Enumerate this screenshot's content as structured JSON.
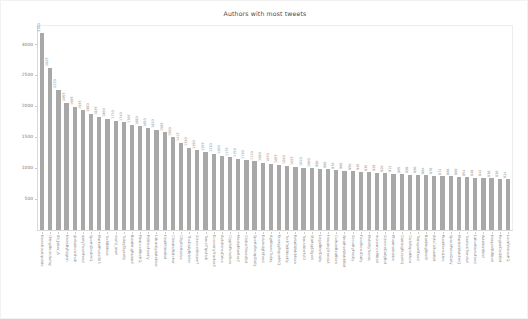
{
  "figure": {
    "title": "Authors with most tweets",
    "background_color": "#ffffff",
    "bar_color": "#a8a8a8",
    "axis_color": "#d9d9d9",
    "text_color": "#777777"
  },
  "legend": {
    "position": "top-right",
    "entries": [
      {
        "label": "author",
        "swatch_name": "legend-swatch-author",
        "color": "#a6a6a6"
      }
    ]
  },
  "chart_data": {
    "type": "bar",
    "title": "Authors with most tweets",
    "xlabel": "",
    "ylabel": "",
    "ylim": [
      0,
      3300
    ],
    "grid": false,
    "legend_position": "top-right",
    "yticks": [
      500,
      1000,
      1500,
      2000,
      2500,
      3000
    ],
    "ytick_labels": [
      "500",
      "1000",
      "1500",
      "2000",
      "2500",
      "3000"
    ],
    "series_name": "author",
    "categories": [
      "NewsHourUpdate",
      "chingdbuncliufay",
      "Ali_Jaber_A",
      "NewsByRegion",
      "globalnewshub",
      "dailyTweetFeed",
      "SportsDeskHQ",
      "MarketPulse365",
      "TechBitNow",
      "world_alert",
      "TodayDigestly",
      "BreakingRadarX",
      "FinanceWireHQ",
      "PoliticoFeedly",
      "UrbanUpdateNow",
      "HealthlineBot",
      "ClimateWatcher",
      "CityAlertsLive",
      "TheDailyBriefer",
      "ScienceStream7",
      "TravelTipsHub",
      "EconomyTrackerX",
      "AutoNewsDrive",
      "CryptoPulseNow",
      "MediaMonitorZ",
      "GlobalTimesBot",
      "SportsRecapDaily",
      "EduInsightFeed",
      "AgriNewsToday",
      "EnergyReportHQ",
      "TechTalkWeekly",
      "RetailWatchNow",
      "TravelAlertsIO",
      "StartupDigest",
      "LegalBriefDaily",
      "HousingTrendsX",
      "CultureBeatNow",
      "WeatherWatchBot",
      "SecurityFeedly",
      "FoodNewsDaily",
      "MobilityTrends",
      "InsuranceWireX",
      "ScienceDailyBot",
      "PharmaInsider",
      "GamingPulseHQ",
      "CivicReportNow",
      "TransportFeed",
      "BankingBriefX",
      "ArtsCultureBot",
      "RuralNewsLine",
      "SpacePulseDaily",
      "MarineWatchHQ",
      "TourismTrendsX",
      "LaborNewsFeed",
      "AviationBrief",
      "NonprofitWireX",
      "RegionDeskBot",
      "LocalVoicesHQ"
    ],
    "values": [
      3180,
      2625,
      2270,
      2055,
      1995,
      1935,
      1880,
      1835,
      1800,
      1770,
      1740,
      1705,
      1680,
      1650,
      1620,
      1585,
      1500,
      1415,
      1330,
      1290,
      1255,
      1230,
      1200,
      1175,
      1150,
      1130,
      1110,
      1090,
      1070,
      1055,
      1040,
      1025,
      1010,
      1000,
      990,
      980,
      970,
      960,
      950,
      945,
      935,
      928,
      920,
      912,
      905,
      898,
      890,
      884,
      878,
      872,
      866,
      860,
      854,
      848,
      842,
      836,
      830,
      824
    ]
  }
}
